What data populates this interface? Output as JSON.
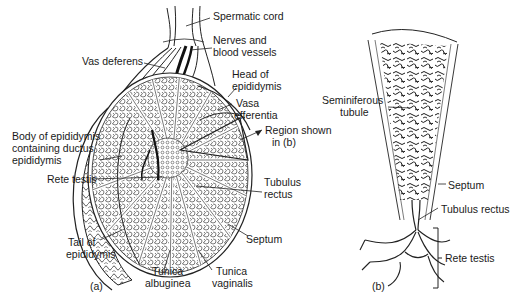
{
  "figure": {
    "panels": [
      {
        "id": "a",
        "label": "(a)",
        "annotations": {
          "spermatic_cord": "Spermatic cord",
          "nerves_line1": "Nerves and",
          "nerves_line2": "blood vessels",
          "vas_deferens": "Vas deferens",
          "head_line1": "Head of",
          "head_line2": "epididymis",
          "vasa_line1": "Vasa",
          "vasa_line2": "efferentia",
          "region_line1": "Region shown",
          "region_line2": "in (b)",
          "body_line1": "Body of epididymis",
          "body_line2": "containing ductus",
          "body_line3": "epididymis",
          "rete_testis": "Rete testis",
          "tubulus_line1": "Tubulus",
          "tubulus_line2": "rectus",
          "tail_line1": "Tail of",
          "tail_line2": "epididymis",
          "septum": "Septum",
          "alb_line1": "Tunica",
          "alb_line2": "albuginea",
          "vag_line1": "Tunica",
          "vag_line2": "vaginalis"
        }
      },
      {
        "id": "b",
        "label": "(b)",
        "annotations": {
          "semi_line1": "Seminiferous",
          "semi_line2": "tubule",
          "septum": "Septum",
          "tubulus_rectus": "Tubulus rectus",
          "rete_testis": "Rete testis"
        }
      }
    ],
    "colors": {
      "ink": "#1a1a1a",
      "background": "#ffffff"
    }
  }
}
